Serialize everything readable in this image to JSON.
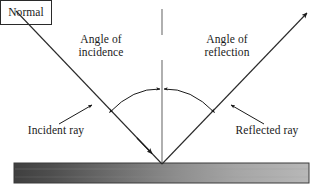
{
  "diagram": {
    "background_color": "#ffffff",
    "line_color": "#2a2a2a",
    "normal_line_color": "#8a8a8a",
    "labels": {
      "angle_of_incidence": "Angle of\nincidence",
      "normal": "Normal",
      "angle_of_reflection": "Angle of\nreflection",
      "incident_ray": "Incident ray",
      "reflected_ray": "Reflected ray"
    },
    "surface": {
      "gradient_start_color": "#4a4a4a",
      "gradient_end_color": "#b4b4b4",
      "border_color": "#3a3a3a"
    },
    "elements": {
      "incident_ray_name": "incident-ray",
      "reflected_ray_name": "reflected-ray",
      "normal_line_name": "normal-line",
      "angle_arc_left_name": "angle-of-incidence-arc",
      "angle_arc_right_name": "angle-of-reflection-arc",
      "surface_name": "reflecting-surface"
    }
  }
}
